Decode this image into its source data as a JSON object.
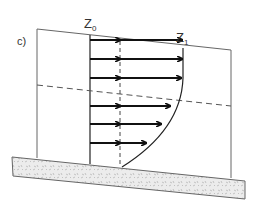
{
  "figure": {
    "panel_label": "c)",
    "labels": {
      "z0": {
        "base": "Z",
        "sub": "0"
      },
      "z1": {
        "base": "Z",
        "sub": "1"
      }
    },
    "colors": {
      "line": "#555555",
      "arrow": "#111111",
      "ground_fill": "#e6e6e6",
      "ground_stroke": "#666666"
    },
    "arrows": [
      {
        "y": 48,
        "x_end": 183
      },
      {
        "y": 67,
        "x_end": 183
      },
      {
        "y": 86,
        "x_end": 180
      },
      {
        "y": 106,
        "x_end": 172
      },
      {
        "y": 124,
        "x_end": 164
      },
      {
        "y": 143,
        "x_end": 146
      }
    ]
  }
}
